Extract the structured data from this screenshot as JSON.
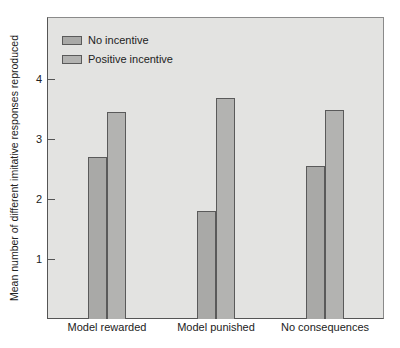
{
  "chart_data": {
    "type": "bar",
    "title": "",
    "xlabel": "",
    "ylabel": "Mean number of different imitative responses reproduced",
    "categories": [
      "Model rewarded",
      "Model punished",
      "No consequences"
    ],
    "series": [
      {
        "name": "No incentive",
        "values": [
          2.7,
          1.8,
          2.55
        ],
        "color": "#a9a9a7"
      },
      {
        "name": "Positive incentive",
        "values": [
          3.45,
          3.68,
          3.48
        ],
        "color": "#b3b3b1"
      }
    ],
    "yticks": [
      "1",
      "2",
      "3",
      "4"
    ],
    "ylim": [
      0,
      5
    ],
    "grid": false,
    "legend_position": "upper left"
  },
  "legend": {
    "items": [
      {
        "label": "No incentive"
      },
      {
        "label": "Positive incentive"
      }
    ]
  }
}
